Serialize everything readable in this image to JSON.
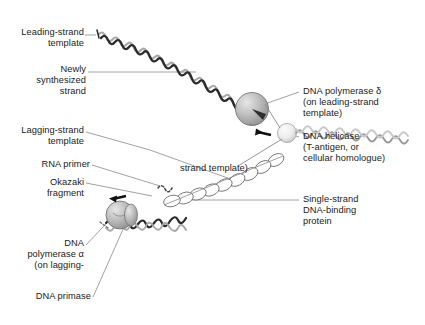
{
  "figure": {
    "background_color": "#ffffff",
    "labels": {
      "leading_strand_template": "Leading-strand\ntemplate",
      "newly_synthesized_strand": "Newly\nsynthesized\nstrand",
      "lagging_strand_template": "Lagging-strand\ntemplate",
      "rna_primer": "RNA primer",
      "okazaki_fragment": "Okazaki\nfragment",
      "dna_polymerase_alpha": "DNA\npolymerase α\n(on lagging-",
      "dna_polymerase_alpha_cont": "strand template)",
      "dna_primase": "DNA primase",
      "dna_polymerase_delta": "DNA polymerase δ\n(on leading-strand\ntemplate)",
      "dna_helicase": "DNA helicase\n(T-antigen, or\ncellular homologue)",
      "single_strand_dna_binding_protein": "Single-strand\nDNA-binding\nprotein"
    },
    "colors": {
      "text": "#1b1b1b",
      "leader_line": "#8a8a8a",
      "dark_strand": "#2b2b2b",
      "light_strand": "#a9a9a9",
      "sphere_fill": "#b6b6b6",
      "sphere_light_fill": "#e2e2e2",
      "ssb_outline": "#6f6f6f",
      "ssb_fill": "#ffffff",
      "arrow": "#111111"
    },
    "elements": {
      "polymerase_delta_sphere": "large gray shaded sphere on leading strand",
      "polymerase_alpha_sphere": "gray shaded sphere on lagging strand",
      "helicase_sphere": "light gray sphere at fork junction",
      "ssb_chain": "chain of white ellipses along lagging-strand template",
      "arrow_delta": "black arrow indicating polymerase delta movement",
      "arrow_alpha": "black arrow indicating polymerase alpha movement"
    }
  }
}
